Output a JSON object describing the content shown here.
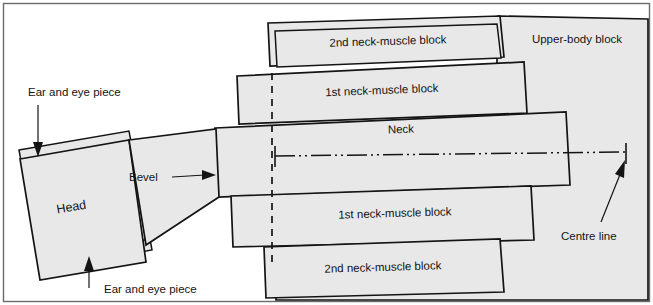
{
  "figure": {
    "background_color": "#ffffff",
    "block_fill_color": "#e8e8e8",
    "line_color": "#141414",
    "frame_color": "#6b6b6b"
  },
  "parts": {
    "head": "Head",
    "neck": "Neck",
    "neck_muscle_block_1_upper": "1st neck-muscle block",
    "neck_muscle_block_2_upper": "2nd neck-muscle block",
    "neck_muscle_block_1_lower": "1st neck-muscle block",
    "neck_muscle_block_2_lower": "2nd neck-muscle block",
    "upper_body_block": "Upper-body block"
  },
  "annotations": {
    "ear_eye_piece_top": "Ear and eye piece",
    "ear_eye_piece_bottom": "Ear and eye piece",
    "bevel": "Bevel",
    "centre_line": "Centre line"
  }
}
